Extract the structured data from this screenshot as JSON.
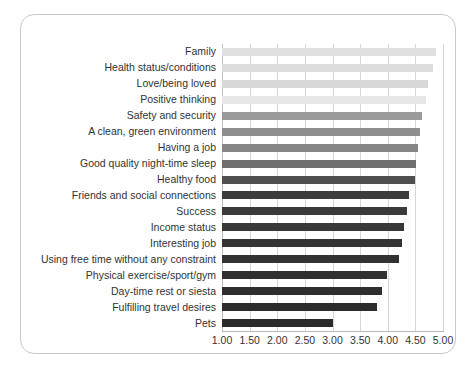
{
  "chart_data": {
    "type": "bar",
    "orientation": "horizontal",
    "title": "",
    "subtitle": "",
    "xlabel": "",
    "ylabel": "",
    "xlim": [
      1.0,
      5.0
    ],
    "xticks": [
      "1.00",
      "1.50",
      "2.00",
      "2.50",
      "3.00",
      "3.50",
      "4.00",
      "4.50",
      "5.00"
    ],
    "xtick_values": [
      1.0,
      1.5,
      2.0,
      2.5,
      3.0,
      3.5,
      4.0,
      4.5,
      5.0
    ],
    "grid": "vertical",
    "legend": "none",
    "categories": [
      "Family",
      "Health status/conditions",
      "Love/being loved",
      "Positive thinking",
      "Safety and security",
      "A clean, green environment",
      "Having a job",
      "Good quality night-time sleep",
      "Healthy food",
      "Friends and social connections",
      "Success",
      "Income status",
      "Interesting job",
      "Using free time without any constraint",
      "Physical exercise/sport/gym",
      "Day-time rest or siesta",
      "Fulfilling travel desires",
      "Pets"
    ],
    "values": [
      4.87,
      4.82,
      4.72,
      4.7,
      4.62,
      4.58,
      4.54,
      4.52,
      4.49,
      4.38,
      4.34,
      4.3,
      4.26,
      4.21,
      3.98,
      3.9,
      3.8,
      3.0
    ],
    "bar_colors": [
      "#e0e0e0",
      "#dcdcdc",
      "#d8d8d8",
      "#e6e6e6",
      "#9a9a9a",
      "#8e8e8e",
      "#868686",
      "#6e6e6e",
      "#4f4f4f",
      "#3c3c3c",
      "#3a3a3a",
      "#383838",
      "#343434",
      "#323232",
      "#303030",
      "#2e2e2e",
      "#2c2c2c",
      "#2a2a2a"
    ]
  },
  "colors": {
    "background": "#ffffff",
    "frame_border": "#c9c9c9",
    "gridline": "#d6d6d6",
    "axis_line": "#b8b8b8",
    "text": "#333333"
  }
}
